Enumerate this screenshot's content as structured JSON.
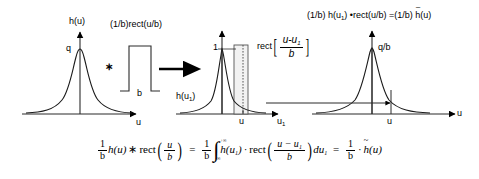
{
  "figure": {
    "kind": "math-diagram",
    "background": "#ffffff",
    "ink": "#000000",
    "curve_color": "#1a1a1a",
    "rect_fill": "#f2f2f2"
  },
  "panel_left": {
    "title": "h(u)",
    "peak_label": "q",
    "axis_label": "u",
    "curve": "bell"
  },
  "operator_convolution": {
    "symbol": "∗",
    "name": "convolution-asterisk"
  },
  "pulse": {
    "title": "(1/b)rect(u/b)",
    "width_label": "b"
  },
  "implication": {
    "symbol": "→",
    "name": "implies-arrow"
  },
  "panel_middle": {
    "peak_label": "1",
    "curve_label": "h(u",
    "curve_label_sub": "1",
    "curve_label_end": ")",
    "axis_label": "u",
    "axis_label_sub": "1",
    "tick_label": "u",
    "rect_label": {
      "fn": "rect",
      "numerator": "u-u",
      "numerator_sub": "1",
      "denominator": "b"
    }
  },
  "panel_right": {
    "title_parts": {
      "p1": "(1/b)  h(u",
      "p1_sub": "1",
      "p2": ") •rect(u/b) =(1/b) ",
      "p3": "h",
      "p4": "(u)"
    },
    "peak_label": "q/b",
    "axis_label": "u",
    "tick_label": "u"
  },
  "equation": {
    "lhs": {
      "coef_num": "1",
      "coef_den": "b",
      "fn": "h(u)",
      "conv": "∗",
      "rect": "rect",
      "arg_num": "u",
      "arg_den": "b"
    },
    "eq1": "=",
    "mid": {
      "coef_num": "1",
      "coef_den": "b",
      "int_top": "+∞",
      "int_bot": "-∞",
      "integrand": "h(u",
      "integrand_sub": "1",
      "integrand_end": ")",
      "dot": "·",
      "rect": "rect",
      "arg_num": "u − u",
      "arg_num_sub": "1",
      "arg_den": "b",
      "du": "du",
      "du_sub": "1"
    },
    "eq2": "=",
    "rhs": {
      "coef_num": "1",
      "coef_den": "b",
      "dot": "·",
      "fn_head": "h",
      "fn_tail": "(u)"
    }
  }
}
